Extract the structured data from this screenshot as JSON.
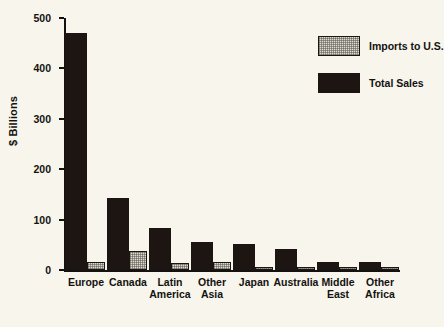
{
  "chart_data": {
    "type": "bar",
    "title": "",
    "xlabel": "",
    "ylabel": "$ Billions",
    "ylim": [
      0,
      500
    ],
    "yticks": [
      0,
      100,
      200,
      300,
      400,
      500
    ],
    "ytick_labels": [
      "0",
      "100",
      "200",
      "300",
      "400",
      "500"
    ],
    "grid": false,
    "legend_position": "top-right",
    "categories": [
      "Europe",
      "Canada",
      "Latin America",
      "Other Asia",
      "Japan",
      "Australia",
      "Middle East",
      "Other Africa"
    ],
    "category_lines": [
      [
        "Europe"
      ],
      [
        "Canada"
      ],
      [
        "Latin",
        "America"
      ],
      [
        "Other",
        "Asia"
      ],
      [
        "Japan"
      ],
      [
        "Australia"
      ],
      [
        "Middle",
        "East"
      ],
      [
        "Other",
        "Africa"
      ]
    ],
    "series": [
      {
        "name": "Total Sales",
        "color": "#1c1512",
        "values": [
          470,
          142,
          84,
          55,
          51,
          42,
          15,
          15
        ]
      },
      {
        "name": "Imports to U.S.",
        "color": "#dedbd2",
        "values": [
          16,
          37,
          13,
          16,
          4,
          2,
          2,
          6
        ]
      }
    ]
  },
  "legend": {
    "items": [
      {
        "label": "Imports to U.S.",
        "swatch": "imports"
      },
      {
        "label": "Total Sales",
        "swatch": "total"
      }
    ]
  },
  "colors": {
    "background": "#f7f5ec",
    "ink": "#141210",
    "total_sales": "#1c1512",
    "imports": "#dedbd2"
  }
}
